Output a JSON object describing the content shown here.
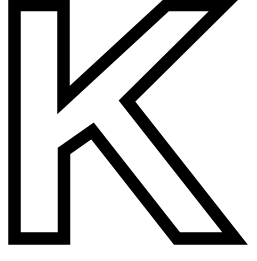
{
  "glyph": {
    "letter": "K",
    "style": "outline",
    "stroke_color": "#000000",
    "fill_color": "#ffffff",
    "background": "#ffffff"
  }
}
